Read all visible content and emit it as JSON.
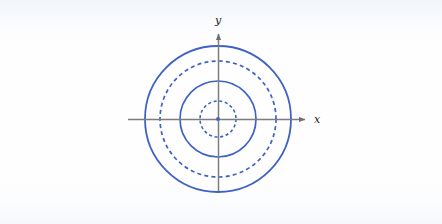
{
  "figure": {
    "title": "",
    "background_color": "#fdfdff",
    "axis_color": "#7d7d7d",
    "curve_color": "#3f63c4",
    "label_color": "#1a1a1a"
  },
  "axes": {
    "x_label": "x",
    "y_label": "y",
    "origin": {
      "x": 218,
      "y": 119
    },
    "x_start_px": 128,
    "x_end_px": 311,
    "y_start_px": 191,
    "y_end_px": 28,
    "arrowheads": true,
    "tick_labels": [],
    "gridlines": false
  },
  "chart_data": {
    "type": "line",
    "title": "",
    "xlabel": "x",
    "ylabel": "y",
    "grid": false,
    "legend": null,
    "axis_origin": [
      0,
      0
    ],
    "series": [
      {
        "name": "circle-1",
        "shape": "circle",
        "center": [
          0,
          0
        ],
        "radius_px": 18,
        "radius_units": 1,
        "style": "dashed",
        "color": "#3f63c4",
        "stroke_width": 1.6,
        "x_intercepts": [
          -18,
          18
        ],
        "y_intercepts": [
          -18,
          18
        ]
      },
      {
        "name": "circle-2",
        "shape": "circle",
        "center": [
          0,
          0
        ],
        "radius_px": 38,
        "radius_units": 2,
        "style": "solid",
        "color": "#3f63c4",
        "stroke_width": 1.7,
        "x_intercepts": [
          -38,
          38
        ],
        "y_intercepts": [
          -38,
          38
        ]
      },
      {
        "name": "circle-3",
        "shape": "circle",
        "center": [
          0,
          0
        ],
        "radius_px": 58,
        "radius_units": 3,
        "style": "dashed",
        "color": "#3f63c4",
        "stroke_width": 1.7,
        "x_intercepts": [
          -58,
          58
        ],
        "y_intercepts": [
          -58,
          58
        ]
      },
      {
        "name": "circle-4",
        "shape": "circle",
        "center": [
          0,
          0
        ],
        "radius_px": 73,
        "radius_units": 4,
        "style": "solid",
        "color": "#3f63c4",
        "stroke_width": 1.8,
        "x_intercepts": [
          -73,
          73
        ],
        "y_intercepts": [
          -73,
          73
        ]
      }
    ],
    "xlim": [
      -90,
      93
    ],
    "ylim": [
      -72,
      91
    ]
  }
}
